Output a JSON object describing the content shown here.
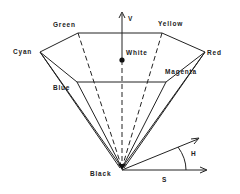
{
  "diagram": {
    "vertices": {
      "cyan": "Cyan",
      "green": "Green",
      "yellow": "Yellow",
      "red": "Red",
      "magenta": "Magenta",
      "blue": "Blue",
      "white": "White",
      "black": "Black"
    },
    "axes": {
      "value": "V",
      "hue": "H",
      "saturation": "S"
    },
    "colors": {
      "line": "#222222",
      "background": "#ffffff"
    }
  }
}
